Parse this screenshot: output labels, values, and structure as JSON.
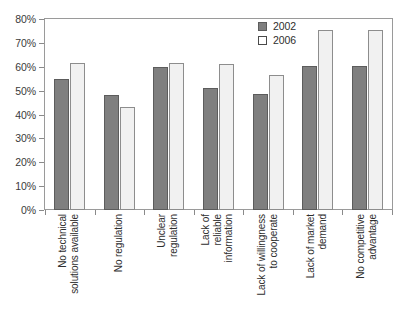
{
  "chart_data": {
    "type": "bar",
    "title": "",
    "subtitle": "",
    "xlabel": "",
    "ylabel": "",
    "ylim": [
      0,
      80
    ],
    "ytick_labels": [
      "0%",
      "10%",
      "20%",
      "30%",
      "40%",
      "50%",
      "60%",
      "70%",
      "80%"
    ],
    "ytick_values": [
      0,
      10,
      20,
      30,
      40,
      50,
      60,
      70,
      80
    ],
    "grid": false,
    "legend_position": "top-right",
    "categories": [
      "No technical\nsolutions available",
      "No regulation",
      "Unclear\nregulation",
      "Lack of\nreliable\ninformation",
      "Lack of willingness\nto cooperate",
      "Lack of market\ndemand",
      "No competitive\nadvantage"
    ],
    "series": [
      {
        "name": "2002",
        "color": "#7f7f7f",
        "values": [
          55,
          48,
          60,
          51,
          48.5,
          60.5,
          60.5
        ]
      },
      {
        "name": "2006",
        "color": "#f1f1f1",
        "values": [
          61.5,
          43,
          61.5,
          61,
          56.5,
          75.5,
          75.5
        ]
      }
    ]
  },
  "legend": {
    "entries": [
      {
        "label": "2002"
      },
      {
        "label": "2006"
      }
    ]
  }
}
